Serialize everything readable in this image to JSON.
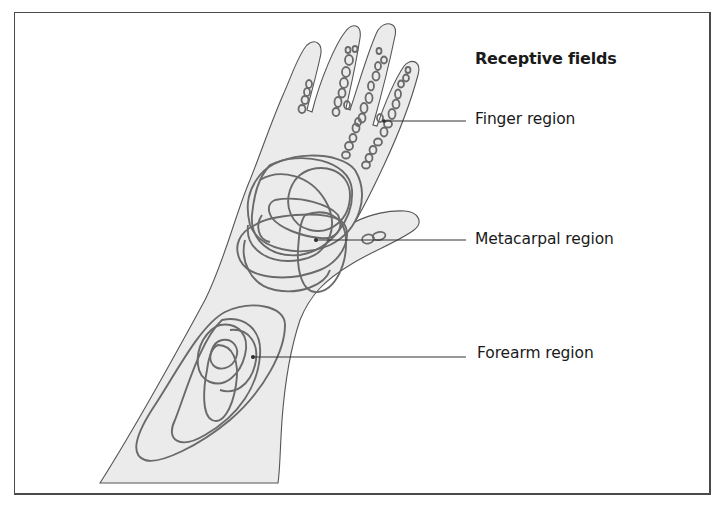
{
  "figure": {
    "title": "Receptive fields",
    "labels": {
      "finger": "Finger region",
      "metacarpal": "Metacarpal region",
      "forearm": "Forearm region"
    },
    "colors": {
      "skin_fill": "#ebebeb",
      "outline": "#555555",
      "field_stroke": "#6a6a6a",
      "leader_line": "#333333",
      "frame": "#4a4a4a"
    }
  }
}
